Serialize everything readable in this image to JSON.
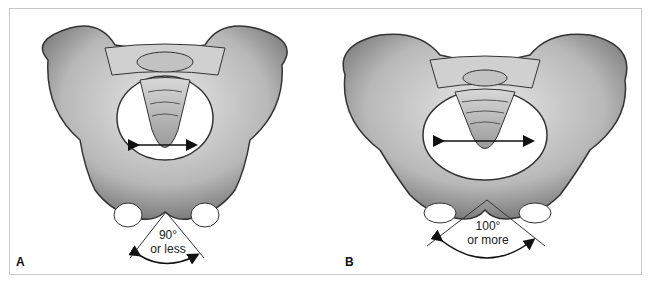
{
  "figure": {
    "panels": [
      {
        "label": "A",
        "angle_value": "90°",
        "angle_qualifier": "or less",
        "description": "Male pelvis, narrow subpubic angle"
      },
      {
        "label": "B",
        "angle_value": "100°",
        "angle_qualifier": "or more",
        "description": "Female pelvis, wide subpubic angle"
      }
    ]
  },
  "colors": {
    "bone": "#c9c9c9",
    "bone_dark": "#7a7a7a",
    "outline": "#333333",
    "border": "#c8c8c8"
  }
}
